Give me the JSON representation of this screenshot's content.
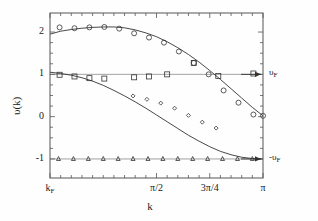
{
  "figure": {
    "background": "#fefefe",
    "frame_color": "#555555",
    "data_color": "#333333",
    "refline_color": "#999999"
  },
  "chart_data": {
    "type": "scatter",
    "title": "",
    "xlabel": "k",
    "ylabel": "υ(k)",
    "xlim": [
      0.0,
      1.0
    ],
    "ylim": [
      -1.45,
      2.45
    ],
    "grid": false,
    "legend": "none",
    "xticks": [
      {
        "pos": 0.0,
        "label": "k_F",
        "major": true
      },
      {
        "pos": 0.5,
        "label": "π/2",
        "major": true
      },
      {
        "pos": 0.75,
        "label": "3π/4",
        "major": true
      },
      {
        "pos": 1.0,
        "label": "π",
        "major": true
      }
    ],
    "xtick_labels": [
      "k",
      "F",
      "π/2",
      "3π/4",
      "π"
    ],
    "yticks": [
      {
        "value": 2,
        "label": "2"
      },
      {
        "value": 1,
        "label": "1"
      },
      {
        "value": 0,
        "label": "0"
      },
      {
        "value": -1,
        "label": "-1"
      }
    ],
    "reference_lines": [
      {
        "value": 1,
        "label": "υ",
        "sublabel": "F",
        "style": "solid-light"
      },
      {
        "value": -1,
        "label": "-υ",
        "sublabel": "F",
        "style": "solid-light"
      }
    ],
    "annotations": [
      {
        "text": "υ",
        "sub": "F",
        "y_value": 1,
        "arrow": "right"
      },
      {
        "text": "-υ",
        "sub": "F",
        "y_value": -1,
        "arrow": "right"
      }
    ],
    "series": [
      {
        "name": "upper-branch-circles",
        "marker": "circle",
        "marker_size": 5,
        "x": [
          0.045,
          0.115,
          0.185,
          0.255,
          0.325,
          0.395,
          0.465,
          0.535,
          0.605,
          0.675,
          0.745,
          0.815,
          0.885,
          0.955,
          1.0
        ],
        "y": [
          2.11,
          2.09,
          2.11,
          2.12,
          2.08,
          1.97,
          1.87,
          1.75,
          1.54,
          1.27,
          1.0,
          0.62,
          0.33,
          0.05,
          0.02
        ]
      },
      {
        "name": "lower-branch-squares",
        "marker": "square",
        "marker_size": 5,
        "x": [
          0.045,
          0.115,
          0.185,
          0.255,
          0.395,
          0.465,
          0.55,
          0.675,
          0.79,
          0.955
        ],
        "y": [
          0.99,
          0.95,
          0.91,
          0.9,
          0.93,
          0.95,
          1.0,
          1.27,
          0.96,
          1.02
        ]
      },
      {
        "name": "mid-branch-diamonds",
        "marker": "diamond",
        "marker_size": 4,
        "x": [
          0.39,
          0.455,
          0.52,
          0.585,
          0.65,
          0.715,
          0.78
        ],
        "y": [
          0.49,
          0.41,
          0.32,
          0.2,
          0.03,
          -0.13,
          -0.27
        ]
      },
      {
        "name": "flat-branch-triangles",
        "marker": "triangle",
        "marker_size": 4,
        "x": [
          0.04,
          0.11,
          0.18,
          0.25,
          0.32,
          0.39,
          0.46,
          0.53,
          0.6,
          0.67,
          0.74,
          0.81,
          0.88,
          0.95
        ],
        "y": [
          -1.0,
          -1.0,
          -1.0,
          -1.0,
          -1.0,
          -1.0,
          -1.0,
          -1.0,
          -1.0,
          -1.0,
          -1.0,
          -1.0,
          -1.0,
          -1.0
        ]
      }
    ],
    "curves": [
      {
        "name": "upper-theory-curve",
        "style": "solid",
        "x": [
          0.0,
          0.05,
          0.1,
          0.15,
          0.2,
          0.25,
          0.3,
          0.35,
          0.4,
          0.45,
          0.5,
          0.55,
          0.6,
          0.65,
          0.7,
          0.75,
          0.8,
          0.85,
          0.9,
          0.95,
          1.0
        ],
        "y": [
          1.95,
          2.02,
          2.06,
          2.09,
          2.11,
          2.12,
          2.12,
          2.1,
          2.05,
          1.98,
          1.89,
          1.77,
          1.63,
          1.47,
          1.29,
          1.09,
          0.88,
          0.66,
          0.44,
          0.22,
          0.02
        ]
      },
      {
        "name": "lower-theory-curve",
        "style": "solid",
        "x": [
          0.0,
          0.05,
          0.1,
          0.15,
          0.2,
          0.25,
          0.3,
          0.35,
          0.4,
          0.45,
          0.5,
          0.55,
          0.6,
          0.65,
          0.7,
          0.75,
          0.8,
          0.85,
          0.9,
          0.95,
          1.0
        ],
        "y": [
          1.05,
          1.02,
          0.98,
          0.92,
          0.84,
          0.74,
          0.62,
          0.49,
          0.35,
          0.2,
          0.04,
          -0.12,
          -0.28,
          -0.44,
          -0.58,
          -0.71,
          -0.82,
          -0.9,
          -0.96,
          -0.99,
          -1.0
        ]
      }
    ]
  }
}
